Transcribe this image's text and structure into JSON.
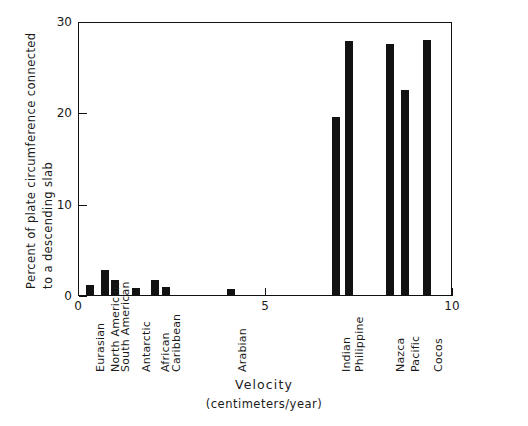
{
  "chart_data": {
    "type": "bar",
    "title": "",
    "xlabel": "Velocity",
    "xlabel_units": "(centimeters/year)",
    "ylabel_line1": "Percent of plate circumference connected",
    "ylabel_line2": "to a descending slab",
    "ylim": [
      0,
      30
    ],
    "xlim": [
      0,
      10
    ],
    "ytick_labels": [
      "0",
      "10",
      "20",
      "30"
    ],
    "ytick_values": [
      0,
      10,
      20,
      30
    ],
    "xtick_labels": [
      "0",
      "5",
      "10"
    ],
    "xtick_values": [
      0,
      5,
      10
    ],
    "grid": false,
    "legend": "none",
    "bar_color": "#121212",
    "categories": [
      "Eurasian",
      "North American",
      "South American",
      "Antarctic",
      "African",
      "Caribbean",
      "Arabian",
      "Indian",
      "Philippine",
      "Nazca",
      "Pacific",
      "Cocos"
    ],
    "x_values": [
      0.32,
      0.72,
      0.98,
      1.55,
      2.05,
      2.35,
      4.1,
      6.9,
      7.25,
      8.35,
      8.75,
      9.35
    ],
    "values": [
      1.2,
      2.8,
      1.8,
      0.9,
      1.7,
      1.0,
      0.8,
      19.6,
      27.9,
      27.6,
      22.6,
      28.0
    ]
  },
  "axis_titles": {
    "y_line1": "Percent of plate circumference connected",
    "y_line2": "to a descending slab",
    "x_main": "Velocity",
    "x_units": "(centimeters/year)"
  }
}
